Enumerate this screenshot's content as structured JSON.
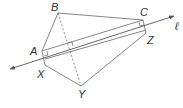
{
  "diagram": {
    "type": "geometry",
    "labels": {
      "A": "A",
      "B": "B",
      "C": "C",
      "X": "X",
      "Y": "Y",
      "Z": "Z",
      "line": "ℓ"
    },
    "colors": {
      "stroke": "#555555",
      "text": "#333333",
      "background": "#ffffff"
    }
  }
}
